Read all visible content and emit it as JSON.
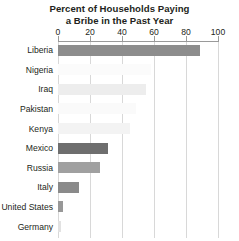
{
  "chart_data": {
    "type": "bar",
    "orientation": "horizontal",
    "title": "Percent of Households Paying a Bribe in the Past Year",
    "title_lines": [
      "Percent of Households Paying",
      "a Bribe in the Past Year"
    ],
    "xlabel": "",
    "ylabel": "",
    "xlim": [
      0,
      100
    ],
    "xticks": [
      0,
      20,
      40,
      60,
      80,
      100
    ],
    "xtick_labels": [
      "0",
      "20",
      "40",
      "60",
      "80",
      "100"
    ],
    "grid": true,
    "grid_axis": "x",
    "legend": false,
    "categories": [
      "Liberia",
      "Nigeria",
      "Iraq",
      "Pakistan",
      "Kenya",
      "Mexico",
      "Russia",
      "Italy",
      "United States",
      "Germany"
    ],
    "values": [
      89,
      58,
      55,
      49,
      45,
      31,
      26,
      13,
      3,
      2
    ],
    "bar_colors": [
      "#8d8d8d",
      "#fbfbfb",
      "#ededed",
      "#fafafa",
      "#f3f3f3",
      "#6e6e6e",
      "#a0a0a0",
      "#8a8a8a",
      "#989898",
      "#e2e2e2"
    ],
    "axis_color": "#9a9a9a",
    "grid_color": "#d8d8d8",
    "text_color": "#231f20",
    "background": "#ffffff"
  }
}
